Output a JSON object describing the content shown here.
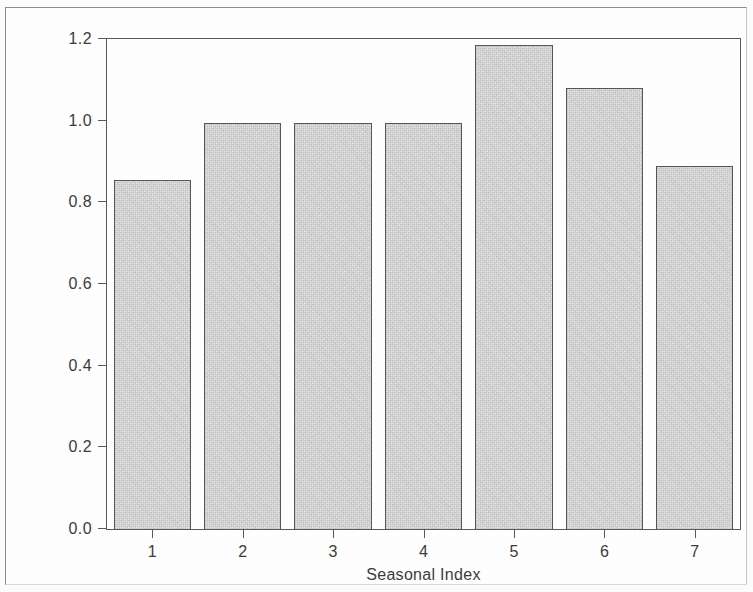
{
  "chart_data": {
    "type": "bar",
    "title": "",
    "xlabel": "Seasonal Index",
    "ylabel": "Seasonal Component",
    "categories": [
      "1",
      "2",
      "3",
      "4",
      "5",
      "6",
      "7"
    ],
    "values": [
      0.855,
      0.995,
      0.995,
      0.995,
      1.185,
      1.08,
      0.89
    ],
    "ylim": [
      0.0,
      1.2
    ],
    "xlim": [
      0.5,
      7.5
    ],
    "ytick_labels": [
      "0.0",
      "0.2",
      "0.4",
      "0.6",
      "0.8",
      "1.0",
      "1.2"
    ],
    "ytick_values": [
      0.0,
      0.2,
      0.4,
      0.6,
      0.8,
      1.0,
      1.2
    ],
    "xtick_labels": [
      "1",
      "2",
      "3",
      "4",
      "5",
      "6",
      "7"
    ],
    "grid": false,
    "legend": false,
    "legend_position": "none",
    "bar_fill_color": "#e9e9e9",
    "bar_edge_color": "#575757",
    "axis_color": "#5a5a5a",
    "text_color": "#3c3c3c",
    "background_color": "#ffffff"
  },
  "figure": {
    "frame_border_color": "#8e8e8e"
  }
}
